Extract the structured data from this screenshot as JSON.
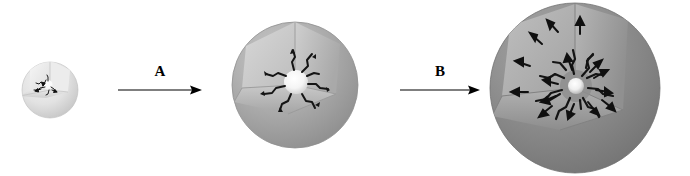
{
  "figure": {
    "title": "",
    "background_color": "#ffffff",
    "width": 690,
    "height": 176
  },
  "stages": [
    {
      "id": "stage-1",
      "name": "small-cutaway-sphere",
      "label": "",
      "center_x": 50,
      "center_y": 90,
      "radius": 28,
      "shell_color": "#dcdcdc",
      "shell_shadow_color": "#b9b9b9",
      "wedge_face_light": "#efefef",
      "wedge_face_dark": "#d2d2d2",
      "core_color": "#ffffff",
      "core_radius": 5,
      "crack_color": "#1a1a1a",
      "crack_count": 5,
      "arrow_count": 3,
      "arrow_color": "#111111"
    },
    {
      "id": "stage-2",
      "name": "medium-cutaway-sphere",
      "label": "",
      "center_x": 295,
      "center_y": 85,
      "radius": 63,
      "shell_color": "#a8a8a8",
      "shell_shadow_color": "#8a8a8a",
      "wedge_face_light": "#cfcfcf",
      "wedge_face_dark": "#b0b0b0",
      "core_color": "#fbfbfb",
      "core_radius": 12,
      "crack_color": "#141414",
      "crack_count": 8,
      "arrow_count": 0,
      "arrow_color": "#111111"
    },
    {
      "id": "stage-3",
      "name": "large-cutaway-sphere",
      "label": "",
      "center_x": 575,
      "center_y": 88,
      "radius": 85,
      "shell_color": "#8c8c8c",
      "shell_shadow_color": "#6f6f6f",
      "wedge_face_light": "#b4b4b4",
      "wedge_face_dark": "#979797",
      "core_color": "#f2f2f2",
      "core_radius": 8,
      "crack_color": "#141414",
      "crack_count": 12,
      "arrow_count": 16,
      "arrow_color": "#101010"
    }
  ],
  "reaction_arrows": [
    {
      "id": "arrow-a",
      "label": "A",
      "x_start": 118,
      "x_end": 202,
      "y": 90,
      "label_x": 160,
      "label_y": 72,
      "color": "#000000"
    },
    {
      "id": "arrow-b",
      "label": "B",
      "x_start": 400,
      "x_end": 480,
      "y": 90,
      "label_x": 440,
      "label_y": 72,
      "color": "#000000"
    }
  ]
}
